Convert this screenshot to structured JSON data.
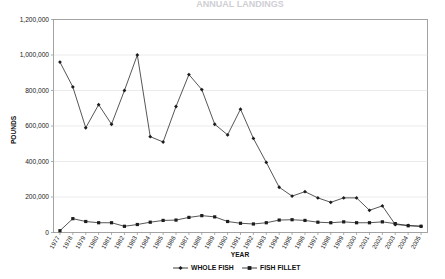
{
  "chart_data": {
    "type": "line",
    "title": "ANNUAL LANDINGS",
    "xlabel": "YEAR",
    "ylabel": "POUNDS",
    "ylim": [
      0,
      1200000
    ],
    "ytick_values": [
      0,
      200000,
      400000,
      600000,
      800000,
      1000000,
      1200000
    ],
    "ytick_labels": [
      "0",
      "200,000",
      "400,000",
      "600,000",
      "800,000",
      "1,000,000",
      "1,200,000"
    ],
    "grid": true,
    "legend_position": "bottom",
    "categories": [
      "1977",
      "1978",
      "1979",
      "1980",
      "1981",
      "1982",
      "1983",
      "1984",
      "1985",
      "1986",
      "1987",
      "1988",
      "1989",
      "1990",
      "1991",
      "1992",
      "1993",
      "1994",
      "1995",
      "1996",
      "1997",
      "1998",
      "1999",
      "2000",
      "2001",
      "2002",
      "2003",
      "2004",
      "2005"
    ],
    "series": [
      {
        "name": "WHOLE FISH",
        "marker": "diamond",
        "values": [
          960000,
          820000,
          590000,
          720000,
          610000,
          800000,
          1000000,
          540000,
          510000,
          710000,
          890000,
          805000,
          610000,
          550000,
          695000,
          530000,
          395000,
          255000,
          205000,
          230000,
          195000,
          170000,
          195000,
          195000,
          125000,
          150000,
          45000,
          40000,
          35000
        ]
      },
      {
        "name": "FISH FILLET",
        "marker": "square",
        "values": [
          10000,
          78000,
          62000,
          55000,
          55000,
          35000,
          45000,
          58000,
          68000,
          70000,
          85000,
          95000,
          88000,
          62000,
          52000,
          48000,
          55000,
          70000,
          72000,
          68000,
          58000,
          55000,
          60000,
          55000,
          55000,
          60000,
          50000,
          38000,
          35000
        ]
      }
    ]
  },
  "legend": {
    "items": [
      {
        "label": "WHOLE FISH"
      },
      {
        "label": "FISH FILLET"
      }
    ]
  }
}
